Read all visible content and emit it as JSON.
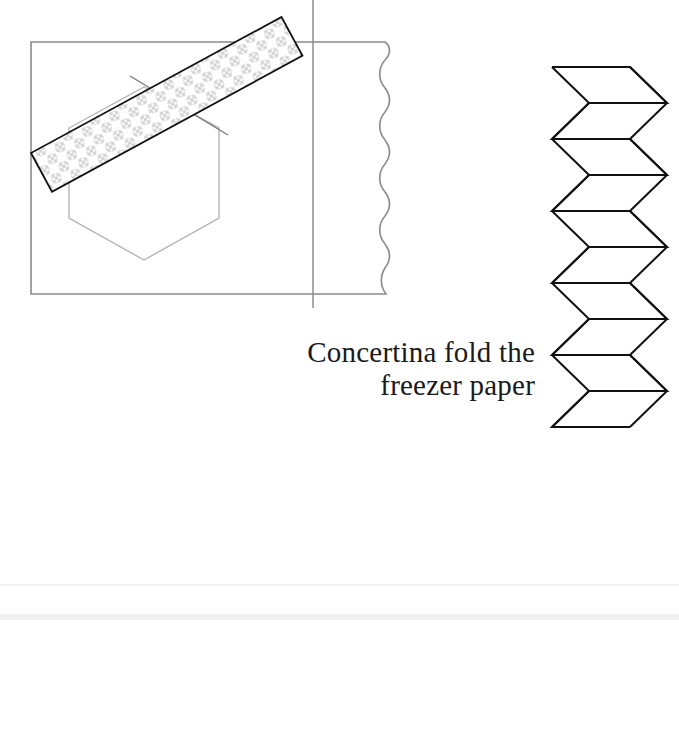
{
  "caption": {
    "line1": "Concertina fold the",
    "line2": "freezer paper"
  },
  "figures": [
    {
      "id": "paper-with-tape",
      "description": "Paper sheet with wavy right edge, hexagon template held by diagonal patterned tape strip"
    },
    {
      "id": "concertina-fold",
      "description": "Zig-zag concertina folded freezer paper strip",
      "folds": 10
    },
    {
      "id": "stacked-sheets-hexagon",
      "description": "Stack of sheets with hexagon marked and three tacking stitches"
    },
    {
      "id": "stacked-sheets-half-hexagon",
      "description": "Stack of sheets with partial hexagon, cropped at bottom"
    }
  ],
  "colors": {
    "outline": "#111111",
    "guide_line": "#7a7a7a",
    "light_line": "#b5b5b5",
    "tape_pattern": "#c4c4c4",
    "background": "#ffffff"
  }
}
